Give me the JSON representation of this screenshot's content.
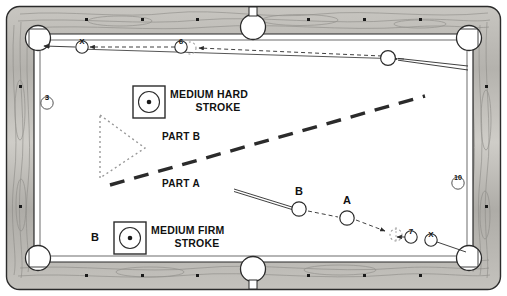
{
  "diagram": {
    "table": {
      "rail_color": "#b9b7b2",
      "cloth_color": "#ffffff",
      "line_color": "#2b2b2b",
      "pocket_count": 6,
      "sight_dot_count": 16
    },
    "stroke_boxes": [
      {
        "id": "medium-hard",
        "line1": "MEDIUM HARD",
        "line2": "STROKE",
        "icon": "center-hit-ball-icon",
        "prefix_label": ""
      },
      {
        "id": "medium-firm",
        "line1": "MEDIUM FIRM",
        "line2": "STROKE",
        "icon": "center-hit-ball-icon",
        "prefix_label": "B"
      }
    ],
    "part_labels": [
      {
        "id": "part-b",
        "text": "PART B"
      },
      {
        "id": "part-a",
        "text": "PART A"
      }
    ],
    "ball_markers": [
      {
        "id": "rail-ball-3",
        "text": "3",
        "shape": "circle"
      },
      {
        "id": "rail-ball-10",
        "text": "10",
        "shape": "circle"
      },
      {
        "id": "top-marker-x",
        "text": "X",
        "shape": "circle"
      },
      {
        "id": "top-marker-6",
        "text": "6",
        "shape": "circle"
      },
      {
        "id": "bottom-marker-7",
        "text": "7",
        "shape": "circle"
      },
      {
        "id": "bottom-marker-x",
        "text": "X",
        "shape": "circle"
      }
    ],
    "cue_ball_labels": [
      {
        "id": "ball-b-lower",
        "text": "B"
      },
      {
        "id": "ball-a-lower",
        "text": "A"
      }
    ],
    "legend_notes": {
      "dotted_triangle": "rack outline",
      "dashed_heavy_line": "part divider",
      "arrows": "ball travel direction"
    }
  }
}
